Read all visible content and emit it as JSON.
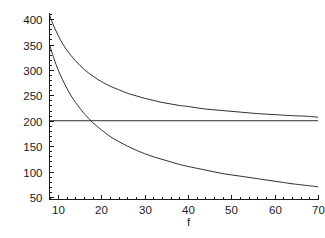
{
  "chart_data": {
    "type": "line",
    "title": "",
    "subtitle": "",
    "xlabel": "f",
    "ylabel": "",
    "xlim": [
      8,
      70
    ],
    "ylim": [
      45,
      412
    ],
    "grid": false,
    "legend": null,
    "x_ticks": [
      10,
      20,
      30,
      40,
      50,
      60,
      70
    ],
    "x_tick_labels": [
      "10",
      "20",
      "30",
      "40",
      "50",
      "60",
      "70"
    ],
    "y_ticks": [
      50,
      100,
      150,
      200,
      250,
      300,
      350,
      400
    ],
    "y_tick_labels": [
      "50",
      "100",
      "150",
      "200",
      "250",
      "300",
      "350",
      "400"
    ],
    "x_minor_step": 2,
    "y_minor_step": 10,
    "series": [
      {
        "name": "upper-curve",
        "x": [
          8,
          9,
          10,
          11,
          12,
          13,
          14,
          15,
          16,
          17,
          18,
          19,
          20,
          22,
          24,
          26,
          28,
          30,
          32,
          34,
          36,
          38,
          40,
          44,
          48,
          52,
          56,
          60,
          64,
          67,
          70
        ],
        "values": [
          408,
          386,
          368,
          352,
          339,
          328,
          318,
          309,
          301,
          294,
          288,
          282,
          277,
          268,
          261,
          254,
          249,
          244,
          240,
          236,
          233,
          230,
          228,
          223,
          220,
          217,
          214,
          212,
          210,
          209,
          207
        ]
      },
      {
        "name": "constant-line",
        "x": [
          8,
          70
        ],
        "values": [
          200,
          200
        ]
      },
      {
        "name": "lower-curve",
        "x": [
          8,
          9,
          10,
          11,
          12,
          13,
          14,
          15,
          16,
          17,
          18,
          19,
          20,
          22,
          24,
          26,
          28,
          30,
          32,
          34,
          36,
          38,
          40,
          44,
          48,
          52,
          56,
          60,
          64,
          67,
          70
        ],
        "values": [
          350,
          323,
          300,
          281,
          264,
          249,
          236,
          225,
          214,
          205,
          196,
          189,
          182,
          169,
          159,
          150,
          142,
          135,
          129,
          124,
          119,
          114,
          110,
          103,
          96,
          91,
          86,
          81,
          76,
          73,
          70
        ]
      }
    ],
    "annotations": [],
    "intersection_note": ""
  }
}
